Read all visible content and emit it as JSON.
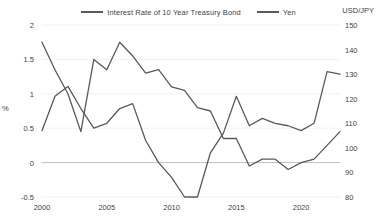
{
  "chart_data": {
    "type": "line",
    "title": "",
    "xlabel": "",
    "ylabel": "%",
    "y2label": "USD/JPY",
    "grid": true,
    "legend_position": "top-center",
    "xlim": [
      2000,
      2023
    ],
    "xticks": [
      2000,
      2005,
      2010,
      2015,
      2020
    ],
    "xticklabels": [
      "2000",
      "2005",
      "2010",
      "2015",
      "2020"
    ],
    "ylim": [
      -0.5,
      2
    ],
    "yticks": [
      -0.5,
      0,
      0.5,
      1,
      1.5,
      2
    ],
    "yticklabels": [
      "-0.5",
      "0",
      "0.5",
      "1",
      "1.5",
      "2"
    ],
    "y2lim": [
      150,
      80
    ],
    "y2ticks": [
      80,
      90,
      100,
      110,
      120,
      130,
      140,
      150
    ],
    "y2ticklabels": [
      "80",
      "90",
      "100",
      "110",
      "120",
      "130",
      "140",
      "150"
    ],
    "y2_inverted": true,
    "series": [
      {
        "name": "Interest Rate of 10 Year Treasury Bond",
        "axis": "left",
        "color": "#595959",
        "x": [
          2000,
          2001,
          2002,
          2003,
          2004,
          2005,
          2006,
          2007,
          2008,
          2009,
          2010,
          2011,
          2012,
          2013,
          2014,
          2015,
          2016,
          2017,
          2018,
          2019,
          2020,
          2021,
          2022,
          2023
        ],
        "values": [
          1.75,
          1.35,
          1.0,
          0.45,
          1.5,
          1.35,
          1.75,
          1.55,
          1.3,
          1.35,
          1.1,
          1.05,
          0.8,
          0.75,
          0.35,
          0.35,
          -0.05,
          0.05,
          0.05,
          -0.1,
          0.0,
          0.05,
          0.25,
          0.45
        ]
      },
      {
        "name": "Yen",
        "axis": "right",
        "color": "#595959",
        "x": [
          2000,
          2001,
          2002,
          2003,
          2004,
          2005,
          2006,
          2007,
          2008,
          2009,
          2010,
          2011,
          2012,
          2013,
          2014,
          2015,
          2016,
          2017,
          2018,
          2019,
          2020,
          2021,
          2022,
          2023
        ],
        "values": [
          107,
          121,
          125,
          116,
          108,
          110,
          116,
          118,
          103,
          94,
          88,
          80,
          80,
          98,
          106,
          121,
          109,
          112,
          110,
          109,
          107,
          110,
          131,
          130
        ]
      }
    ]
  },
  "legend": {
    "entries": [
      {
        "label": "Interest Rate of 10 Year Treasury Bond"
      },
      {
        "label": "Yen"
      }
    ]
  },
  "axes": {
    "left_title": "%",
    "right_title": "USD/JPY"
  }
}
